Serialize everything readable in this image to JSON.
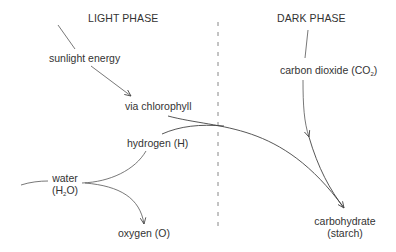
{
  "diagram": {
    "headers": {
      "light": "LIGHT PHASE",
      "dark": "DARK PHASE"
    },
    "nodes": {
      "sunlight": "sunlight energy",
      "chlorophyll": "via chlorophyll",
      "hydrogen": "hydrogen (H)",
      "water_line1": "water",
      "water_line2_pre": "(H",
      "water_line2_sub": "2",
      "water_line2_post": "O)",
      "oxygen": "oxygen (O)",
      "co2_pre": "carbon dioxide (CO",
      "co2_sub": "2",
      "co2_post": ")",
      "carb_line1": "carbohydrate",
      "carb_line2": "(starch)"
    },
    "edges": [
      {
        "from": "input",
        "to": "sunlight energy"
      },
      {
        "from": "sunlight energy",
        "to": "via chlorophyll"
      },
      {
        "from": "via chlorophyll",
        "to": "carbohydrate"
      },
      {
        "from": "input",
        "to": "water"
      },
      {
        "from": "water",
        "to": "hydrogen (H)"
      },
      {
        "from": "water",
        "to": "oxygen (O)"
      },
      {
        "from": "hydrogen (H)",
        "to": "carbohydrate"
      },
      {
        "from": "dark-phase-header",
        "to": "carbon dioxide (CO2)"
      },
      {
        "from": "carbon dioxide (CO2)",
        "to": "carbohydrate"
      }
    ],
    "divider": "dashed"
  }
}
